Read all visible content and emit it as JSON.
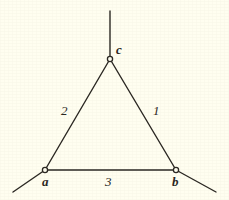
{
  "figure": {
    "background_color": "#fffef0",
    "ink_color": "#2a2722",
    "width": 229,
    "height": 200
  },
  "chart_data": {
    "type": "diagram",
    "subtype": "labeled-triangle-graph",
    "title": "",
    "nodes": [
      {
        "id": "c",
        "label": "c",
        "x": 110,
        "y": 59,
        "label_x": 116,
        "label_y": 43,
        "marker": "open-circle"
      },
      {
        "id": "a",
        "label": "a",
        "x": 45,
        "y": 170,
        "label_x": 42,
        "label_y": 175,
        "marker": "open-circle"
      },
      {
        "id": "b",
        "label": "b",
        "x": 176,
        "y": 170,
        "label_x": 172,
        "label_y": 175,
        "marker": "open-circle"
      }
    ],
    "edges": [
      {
        "id": "e1",
        "from": "b",
        "to": "c",
        "label": "1",
        "label_x": 153,
        "label_y": 104
      },
      {
        "id": "e2",
        "from": "a",
        "to": "c",
        "label": "2",
        "label_x": 61,
        "label_y": 104
      },
      {
        "id": "e3",
        "from": "a",
        "to": "b",
        "label": "3",
        "label_x": 105,
        "label_y": 175
      }
    ],
    "pendant_edges": [
      {
        "id": "p-c",
        "from": "c",
        "x1": 110,
        "y1": 59,
        "x2": 110,
        "y2": 11
      },
      {
        "id": "p-a",
        "from": "a",
        "x1": 45,
        "y1": 170,
        "x2": 13,
        "y2": 192
      },
      {
        "id": "p-b",
        "from": "b",
        "x1": 176,
        "y1": 170,
        "x2": 216,
        "y2": 192
      }
    ]
  }
}
